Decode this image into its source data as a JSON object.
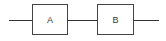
{
  "diagram": {
    "type": "block-chain",
    "blocks": [
      {
        "label": "A"
      },
      {
        "label": "B"
      }
    ],
    "connections": [
      "input -> A",
      "A -> B",
      "B -> output"
    ],
    "colors": {
      "stroke": "#333333",
      "background": "#ffffff"
    }
  }
}
